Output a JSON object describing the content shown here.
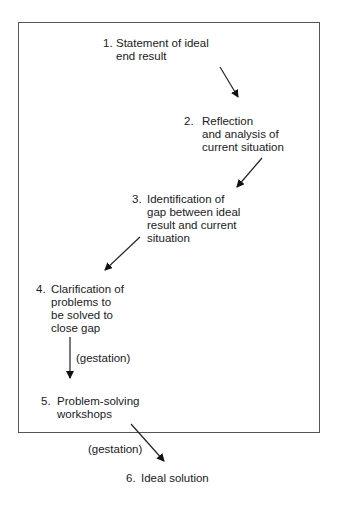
{
  "diagram": {
    "steps": [
      {
        "num": "1.",
        "text": "Statement of ideal\nend result"
      },
      {
        "num": "2.",
        "text": "Reflection\nand analysis of\ncurrent situation"
      },
      {
        "num": "3.",
        "text": "Identification of\ngap between ideal\nresult and current\nsituation"
      },
      {
        "num": "4.",
        "text": "Clarification of\nproblems to\nbe solved to\nclose gap"
      },
      {
        "num": "5.",
        "text": "Problem-solving\nworkshops"
      },
      {
        "num": "6.",
        "text": "Ideal solution"
      }
    ],
    "arrow_labels": [
      "(gestation)",
      "(gestation)"
    ]
  }
}
